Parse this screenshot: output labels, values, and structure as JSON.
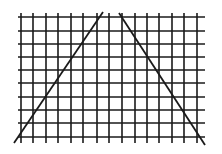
{
  "diagram": {
    "background": "#ffffff",
    "line_color": "#1a1a1a",
    "grid": {
      "vertical_x": [
        21,
        33,
        46,
        58,
        71,
        83,
        97,
        109,
        122,
        135,
        147,
        159,
        172,
        184,
        197
      ],
      "horizontal_y": [
        17,
        31,
        44,
        57,
        70,
        83,
        97,
        110,
        123,
        137
      ],
      "x_min": 18,
      "x_max": 205,
      "y_min": 13,
      "y_max": 143,
      "stroke_width": 1.6
    },
    "diagonals": [
      {
        "name": "left-diagonal",
        "x1": 14,
        "y1": 143,
        "x2": 103,
        "y2": 12
      },
      {
        "name": "right-diagonal",
        "x1": 119,
        "y1": 13,
        "x2": 205,
        "y2": 145
      }
    ]
  }
}
